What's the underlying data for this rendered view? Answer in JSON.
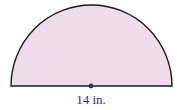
{
  "figure": {
    "shape": "semicircle",
    "diameter_label": "14 in.",
    "fill_color": "#eedcea",
    "stroke_color": "#1a1a1a",
    "center_dot_color": "#2e2a8c",
    "label_color": "#2e2a8c"
  }
}
